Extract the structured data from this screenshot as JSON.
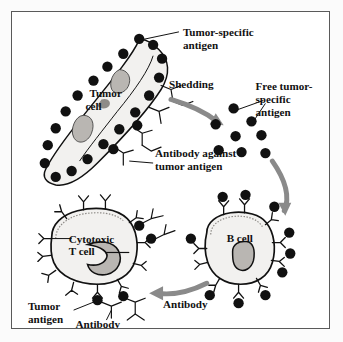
{
  "figure": {
    "title_present": false,
    "border_color": "#5a5a5a",
    "background": "#ffffff",
    "page_background": "#fbfbfb",
    "ink_color": "#111111",
    "arrow_color": "#8a8a8a",
    "cell_fill": "#f2f1ef",
    "nucleus_fill": "#b9b6b2"
  },
  "labels": {
    "tumor_specific_antigen": "Tumor-specific\nantigen",
    "tumor_specific_antigen_l1": "Tumor-specific",
    "tumor_specific_antigen_l2": "antigen",
    "shedding": "Shedding",
    "free_antigen_l1": "Free tumor-",
    "free_antigen_l2": "specific",
    "free_antigen_l3": "antigen",
    "antibody_against_l1": "Antibody against",
    "antibody_against_l2": "tumor antigen",
    "tumor_cell_l1": "Tumor",
    "tumor_cell_l2": "cell",
    "cytotoxic_t_cell_l1": "Cytotoxic",
    "cytotoxic_t_cell_l2": "T cell",
    "b_cell": "B  cell",
    "tumor_antigen_l1": "Tumor",
    "tumor_antigen_l2": "antigen",
    "antibody_bottom_left": "Antibody",
    "antibody_arrow": "Antibody"
  },
  "diagram": {
    "type": "immunology-cycle-diagram",
    "nodes": [
      {
        "id": "tumor-cell",
        "label": "Tumor cell",
        "position": "top-left"
      },
      {
        "id": "free-antigen-cluster",
        "label": "Free tumor-specific antigen",
        "position": "top-right",
        "dot_count": 8
      },
      {
        "id": "b-cell",
        "label": "B cell",
        "position": "bottom-right"
      },
      {
        "id": "cytotoxic-t-cell",
        "label": "Cytotoxic T cell",
        "position": "bottom-left"
      }
    ],
    "arrows": [
      {
        "id": "shedding-arrow",
        "label": "Shedding",
        "from": "tumor-cell",
        "to": "free-antigen-cluster"
      },
      {
        "id": "antigen-to-bcell-arrow",
        "label": "",
        "from": "free-antigen-cluster",
        "to": "b-cell"
      },
      {
        "id": "antibody-arrow",
        "label": "Antibody",
        "from": "b-cell",
        "to": "cytotoxic-t-cell"
      }
    ]
  }
}
